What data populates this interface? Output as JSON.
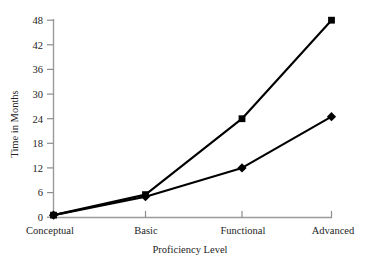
{
  "chart_data": {
    "type": "line",
    "title": "",
    "xlabel": "Proficiency Level",
    "ylabel": "Time in Months",
    "categories": [
      "Conceptual",
      "Basic",
      "Functional",
      "Advanced"
    ],
    "yticks": [
      0,
      6,
      12,
      18,
      24,
      30,
      36,
      42,
      48
    ],
    "ylim": [
      0,
      48
    ],
    "grid": false,
    "legend": "none",
    "series": [
      {
        "name": "series-square",
        "marker": "square",
        "color": "#000000",
        "values": [
          0.5,
          5.5,
          24,
          48
        ]
      },
      {
        "name": "series-diamond",
        "marker": "diamond",
        "color": "#000000",
        "values": [
          0.5,
          5,
          12,
          24.5
        ]
      }
    ]
  },
  "axes": {
    "y_tick_labels": [
      "0",
      "6",
      "12",
      "18",
      "24",
      "30",
      "36",
      "42",
      "48"
    ],
    "x_tick_labels": [
      "Conceptual",
      "Basic",
      "Functional",
      "Advanced"
    ],
    "y_axis_title": "Time in Months",
    "x_axis_title": "Proficiency Level"
  },
  "colors": {
    "axis": "#9a9a9a",
    "line": "#111111",
    "marker": "#000000",
    "text": "#242424",
    "background": "#ffffff"
  }
}
